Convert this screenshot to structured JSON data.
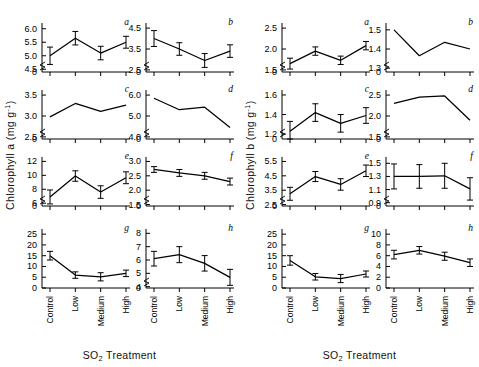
{
  "figure": {
    "blocks": [
      {
        "id": "chlorophyll-a",
        "ylabel": "Chlorophyll a  (mg g",
        "ylabel_sup": "-1",
        "ylabel_end": ")",
        "xlabel_pre": "SO",
        "xlabel_sub": "2",
        "xlabel_post": " Treatment"
      },
      {
        "id": "chlorophyll-b",
        "ylabel": "Chlorophyll b  (mg g",
        "ylabel_sup": "-1",
        "ylabel_end": ")",
        "xlabel_pre": "SO",
        "xlabel_sub": "2",
        "xlabel_post": " Treatment"
      }
    ]
  },
  "chart_data": [
    {
      "panel": "a",
      "block": "chlorophyll-a",
      "type": "line",
      "title": "a",
      "xlabel": "SO2 Treatment",
      "ylabel": "Chlorophyll a (mg g-1)",
      "categories": [
        "Control",
        "Low",
        "Medium",
        "High"
      ],
      "values": [
        5.0,
        5.65,
        5.1,
        5.5
      ],
      "errors": [
        0.32,
        0.25,
        0.25,
        0.22
      ],
      "ticks": [
        4.5,
        5.0,
        5.5,
        6.0
      ],
      "tick_labels": [
        "4.5",
        "5.0",
        "5.5",
        "6.0"
      ],
      "zero_label": "0",
      "ylim": [
        4.4,
        6.1
      ],
      "broken_axis": true,
      "grid": false
    },
    {
      "panel": "b",
      "block": "chlorophyll-a",
      "type": "line",
      "title": "b",
      "xlabel": "SO2 Treatment",
      "ylabel": "Chlorophyll a (mg g-1)",
      "categories": [
        "Control",
        "Low",
        "Medium",
        "High"
      ],
      "values": [
        4.0,
        3.5,
        2.95,
        3.4
      ],
      "errors": [
        0.38,
        0.3,
        0.33,
        0.3
      ],
      "ticks": [
        2.5,
        3.5,
        4.5
      ],
      "tick_labels": [
        "2.5",
        "3.5",
        "4.5"
      ],
      "zero_label": "0",
      "ylim": [
        2.4,
        4.6
      ],
      "broken_axis": true,
      "grid": false
    },
    {
      "panel": "c",
      "block": "chlorophyll-a",
      "type": "line",
      "title": "c",
      "xlabel": "SO2 Treatment",
      "ylabel": "Chlorophyll a (mg g-1)",
      "categories": [
        "Control",
        "Low",
        "Medium",
        "High"
      ],
      "values": [
        2.98,
        3.3,
        3.11,
        3.26
      ],
      "errors": [
        0,
        0,
        0,
        0
      ],
      "ticks": [
        2.5,
        3.0,
        3.5
      ],
      "tick_labels": [
        "2.5",
        "3.0",
        "3.5"
      ],
      "zero_label": "0",
      "ylim": [
        2.45,
        3.55
      ],
      "broken_axis": true,
      "grid": false
    },
    {
      "panel": "d",
      "block": "chlorophyll-a",
      "type": "line",
      "title": "d",
      "xlabel": "SO2 Treatment",
      "ylabel": "Chlorophyll a (mg g-1)",
      "categories": [
        "Control",
        "Low",
        "Medium",
        "High"
      ],
      "values": [
        5.85,
        5.3,
        5.42,
        4.45
      ],
      "errors": [
        0,
        0,
        0,
        0
      ],
      "ticks": [
        4.0,
        5.0,
        6.0
      ],
      "tick_labels": [
        "4.0",
        "5.0",
        "6.0"
      ],
      "zero_label": "0",
      "ylim": [
        3.9,
        6.1
      ],
      "broken_axis": true,
      "grid": false
    },
    {
      "panel": "e",
      "block": "chlorophyll-a",
      "type": "line",
      "title": "e",
      "xlabel": "SO2 Treatment",
      "ylabel": "Chlorophyll a (mg g-1)",
      "categories": [
        "Control",
        "Low",
        "Medium",
        "High"
      ],
      "values": [
        6.9,
        9.9,
        7.6,
        9.65
      ],
      "errors": [
        1.0,
        0.75,
        0.9,
        0.85
      ],
      "ticks": [
        6,
        8,
        10,
        12
      ],
      "tick_labels": [
        "6",
        "8",
        "10",
        "12"
      ],
      "zero_label": "0",
      "ylim": [
        5.6,
        12.2
      ],
      "broken_axis": true,
      "grid": false
    },
    {
      "panel": "f",
      "block": "chlorophyll-a",
      "type": "line",
      "title": "f",
      "xlabel": "SO2 Treatment",
      "ylabel": "Chlorophyll a (mg g-1)",
      "categories": [
        "Control",
        "Low",
        "Medium",
        "High"
      ],
      "values": [
        2.72,
        2.6,
        2.5,
        2.3
      ],
      "errors": [
        0.1,
        0.12,
        0.12,
        0.12
      ],
      "ticks": [
        1.5,
        2.0,
        2.5,
        3.0
      ],
      "tick_labels": [
        "1.5",
        "2.0",
        "2.5",
        "3.0"
      ],
      "zero_label": "0",
      "ylim": [
        1.45,
        3.05
      ],
      "broken_axis": true,
      "grid": false
    },
    {
      "panel": "g",
      "block": "chlorophyll-a",
      "type": "line",
      "title": "g",
      "xlabel": "SO2 Treatment",
      "ylabel": "Chlorophyll a (mg g-1)",
      "categories": [
        "Control",
        "Low",
        "Medium",
        "High"
      ],
      "values": [
        15.0,
        6.0,
        5.2,
        6.8
      ],
      "errors": [
        2.0,
        1.5,
        1.9,
        1.5
      ],
      "ticks": [
        0,
        5,
        10,
        15,
        20,
        25
      ],
      "tick_labels": [
        "0",
        "5",
        "10",
        "15",
        "20",
        "25"
      ],
      "zero_label": "",
      "ylim": [
        0,
        26
      ],
      "broken_axis": false,
      "grid": false
    },
    {
      "panel": "h",
      "block": "chlorophyll-a",
      "type": "line",
      "title": "h",
      "xlabel": "SO2 Treatment",
      "ylabel": "Chlorophyll a (mg g-1)",
      "categories": [
        "Control",
        "Low",
        "Medium",
        "High"
      ],
      "values": [
        6.1,
        6.4,
        5.75,
        4.7
      ],
      "errors": [
        0.55,
        0.6,
        0.58,
        0.6
      ],
      "ticks": [
        4,
        5,
        6,
        7,
        8
      ],
      "tick_labels": [
        "4",
        "5",
        "6",
        "7",
        "8"
      ],
      "zero_label": "0",
      "ylim": [
        3.9,
        8.1
      ],
      "broken_axis": true,
      "grid": false
    },
    {
      "panel": "a",
      "block": "chlorophyll-b",
      "type": "line",
      "title": "a",
      "xlabel": "SO2 Treatment",
      "ylabel": "Chlorophyll b (mg g-1)",
      "categories": [
        "Control",
        "Low",
        "Medium",
        "High"
      ],
      "values": [
        1.65,
        1.95,
        1.73,
        2.08
      ],
      "errors": [
        0.13,
        0.1,
        0.1,
        0.1
      ],
      "ticks": [
        1.5,
        2.0,
        2.5
      ],
      "tick_labels": [
        "1.5",
        "2.0",
        "2.5"
      ],
      "zero_label": "0",
      "ylim": [
        1.45,
        2.55
      ],
      "broken_axis": true,
      "grid": false
    },
    {
      "panel": "b",
      "block": "chlorophyll-b",
      "type": "line",
      "title": "b",
      "xlabel": "SO2 Treatment",
      "ylabel": "Chlorophyll b (mg g-1)",
      "categories": [
        "Control",
        "Low",
        "Medium",
        "High"
      ],
      "values": [
        1.5,
        1.365,
        1.435,
        1.4
      ],
      "errors": [
        0,
        0,
        0,
        0
      ],
      "ticks": [
        1.3,
        1.4,
        1.5
      ],
      "tick_labels": [
        "1.3",
        "1.4",
        "1.5"
      ],
      "zero_label": "0",
      "ylim": [
        1.28,
        1.52
      ],
      "broken_axis": true,
      "grid": false
    },
    {
      "panel": "c",
      "block": "chlorophyll-b",
      "type": "line",
      "title": "c",
      "xlabel": "SO2 Treatment",
      "ylabel": "Chlorophyll b (mg g-1)",
      "categories": [
        "Control",
        "Low",
        "Medium",
        "High"
      ],
      "values": [
        1.23,
        1.42,
        1.31,
        1.39
      ],
      "errors": [
        0.1,
        0.09,
        0.09,
        0.08
      ],
      "ticks": [
        1.2,
        1.4,
        1.6
      ],
      "tick_labels": [
        "1.2",
        "1.4",
        "1.6"
      ],
      "zero_label": "0",
      "ylim": [
        1.15,
        1.62
      ],
      "broken_axis": true,
      "grid": false
    },
    {
      "panel": "d",
      "block": "chlorophyll-b",
      "type": "line",
      "title": "d",
      "xlabel": "SO2 Treatment",
      "ylabel": "Chlorophyll b (mg g-1)",
      "categories": [
        "Control",
        "Low",
        "Medium",
        "High"
      ],
      "values": [
        2.3,
        2.45,
        2.48,
        1.9
      ],
      "errors": [
        0,
        0,
        0,
        0
      ],
      "ticks": [
        1.5,
        2.0,
        2.5
      ],
      "tick_labels": [
        "1.5",
        "2.0",
        "2.5"
      ],
      "zero_label": "0",
      "ylim": [
        1.45,
        2.55
      ],
      "broken_axis": true,
      "grid": false
    },
    {
      "panel": "e",
      "block": "chlorophyll-b",
      "type": "line",
      "title": "e",
      "xlabel": "SO2 Treatment",
      "ylabel": "Chlorophyll b (mg g-1)",
      "categories": [
        "Control",
        "Low",
        "Medium",
        "High"
      ],
      "values": [
        3.25,
        4.45,
        3.9,
        4.85
      ],
      "errors": [
        0.45,
        0.35,
        0.4,
        0.4
      ],
      "ticks": [
        2.5,
        3.5,
        4.5,
        5.5
      ],
      "tick_labels": [
        "2.5",
        "3.5",
        "4.5",
        "5.5"
      ],
      "zero_label": "0",
      "ylim": [
        2.4,
        5.6
      ],
      "broken_axis": true,
      "grid": false
    },
    {
      "panel": "f",
      "block": "chlorophyll-b",
      "type": "line",
      "title": "f",
      "xlabel": "SO2 Treatment",
      "ylabel": "Chlorophyll b (mg g-1)",
      "categories": [
        "Control",
        "Low",
        "Medium",
        "High"
      ],
      "values": [
        1.3,
        1.3,
        1.31,
        1.11
      ],
      "errors": [
        0.19,
        0.18,
        0.19,
        0.17
      ],
      "ticks": [
        0.9,
        1.1,
        1.3,
        1.5
      ],
      "tick_labels": [
        "0.9",
        "1.1",
        "1.3",
        "1.5"
      ],
      "zero_label": "0",
      "ylim": [
        0.85,
        1.55
      ],
      "broken_axis": true,
      "grid": false
    },
    {
      "panel": "g",
      "block": "chlorophyll-b",
      "type": "line",
      "title": "g",
      "xlabel": "SO2 Treatment",
      "ylabel": "Chlorophyll b (mg g-1)",
      "categories": [
        "Control",
        "Low",
        "Medium",
        "High"
      ],
      "values": [
        12.8,
        5.2,
        4.4,
        6.5
      ],
      "errors": [
        2.2,
        1.5,
        1.9,
        1.4
      ],
      "ticks": [
        0,
        5,
        10,
        15,
        20,
        25
      ],
      "tick_labels": [
        "0",
        "5",
        "10",
        "15",
        "20",
        "25"
      ],
      "zero_label": "",
      "ylim": [
        0,
        26
      ],
      "broken_axis": false,
      "grid": false
    },
    {
      "panel": "h",
      "block": "chlorophyll-b",
      "type": "line",
      "title": "h",
      "xlabel": "SO2 Treatment",
      "ylabel": "Chlorophyll b (mg g-1)",
      "categories": [
        "Control",
        "Low",
        "Medium",
        "High"
      ],
      "values": [
        6.2,
        7.0,
        5.9,
        4.7
      ],
      "errors": [
        0.8,
        0.7,
        0.75,
        0.7
      ],
      "ticks": [
        0,
        2,
        4,
        6,
        8,
        10
      ],
      "tick_labels": [
        "0",
        "2",
        "4",
        "6",
        "8",
        "10"
      ],
      "zero_label": "",
      "ylim": [
        0,
        10.4
      ],
      "broken_axis": false,
      "grid": false
    }
  ]
}
